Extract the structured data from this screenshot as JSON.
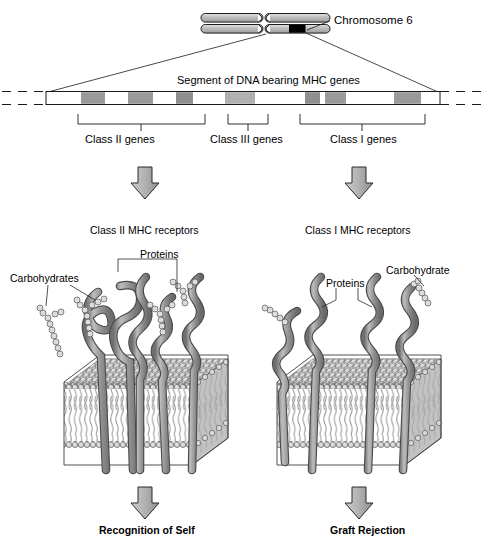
{
  "figure": {
    "title_chromosome": "Chromosome 6",
    "segment_label": "Segment of DNA bearing MHC genes",
    "gene_classes": [
      {
        "label": "Class II genes"
      },
      {
        "label": "Class III genes"
      },
      {
        "label": "Class I genes"
      }
    ],
    "receptor_panels": [
      {
        "heading": "Class II MHC receptors",
        "labels": {
          "carbohydrate": "Carbohydrates",
          "protein": "Proteins"
        },
        "outcome": "Recognition of Self"
      },
      {
        "heading": "Class I MHC receptors",
        "labels": {
          "protein": "Proteins",
          "carbohydrate": "Carbohydrate"
        },
        "outcome": "Graft Rejection"
      }
    ],
    "colors": {
      "gene_band": "#9a9a9a",
      "gene_band_light": "#b4b4b4",
      "centromere_band": "#000000",
      "chromatid_fill": "#b9b9b9",
      "arrow_fill": "#b0b0b0",
      "protein_edge": "#5a5a5a",
      "protein_fill": "#9b9b9b",
      "lipid_head": "#d2d2d2",
      "lipid_tail": "#a8a8a8",
      "outline": "#1a1a1a",
      "background": "#ffffff"
    }
  }
}
